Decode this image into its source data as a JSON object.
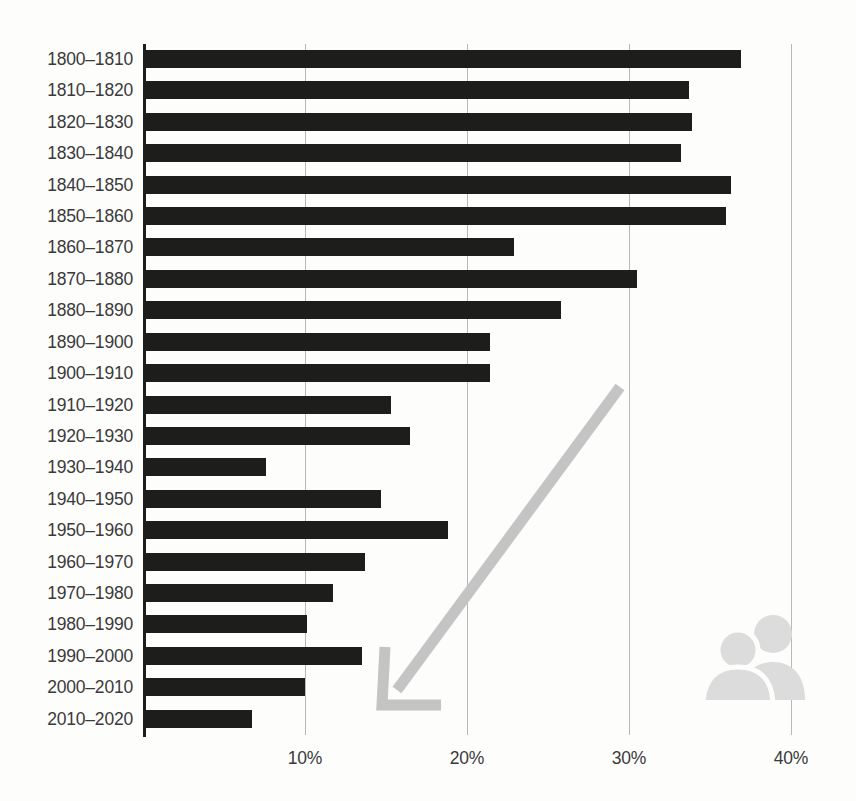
{
  "title": "",
  "colors": {
    "bar": "#1d1d1b",
    "grid": "#b9b9b9",
    "axis": "#1d1d1b",
    "annotation": "#c4c4c4",
    "icon": "#dcdcdc",
    "background": "#fdfdfc",
    "text": "#3a3a3a"
  },
  "icons": {
    "people": "people-icon",
    "arrow": "down-left-trend-arrow-icon"
  },
  "annotation": {
    "arrow_label": "declining trend arrow"
  },
  "chart_data": {
    "type": "bar",
    "orientation": "horizontal",
    "title": "",
    "xlabel": "",
    "ylabel": "",
    "xlim": [
      0,
      42.6
    ],
    "ylim": null,
    "grid": true,
    "grid_axis": "x",
    "legend": false,
    "xticks": [
      10,
      20,
      30,
      40
    ],
    "xticklabels": [
      "10%",
      "20%",
      "30%",
      "40%"
    ],
    "categories": [
      "1800–1810",
      "1810–1820",
      "1820–1830",
      "1830–1840",
      "1840–1850",
      "1850–1860",
      "1860–1870",
      "1870–1880",
      "1880–1890",
      "1890–1900",
      "1900–1910",
      "1910–1920",
      "1920–1930",
      "1930–1940",
      "1940–1950",
      "1950–1960",
      "1960–1970",
      "1970–1980",
      "1980–1990",
      "1990–2000",
      "2000–2010",
      "2010–2020"
    ],
    "values": [
      36.9,
      33.7,
      33.9,
      33.2,
      36.3,
      36.0,
      22.9,
      30.5,
      25.8,
      21.4,
      21.4,
      15.3,
      16.5,
      7.6,
      14.7,
      18.8,
      13.7,
      11.7,
      10.1,
      13.5,
      10.0,
      6.7
    ]
  }
}
